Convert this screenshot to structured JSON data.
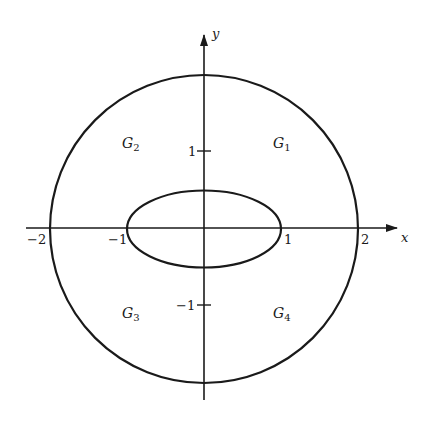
{
  "diagram": {
    "type": "region-plot",
    "colors": {
      "stroke": "#1a1a1a",
      "background": "#ffffff"
    },
    "axes": {
      "x_label": "x",
      "y_label": "y",
      "x_ticks": [
        {
          "value": -2,
          "label": "−2"
        },
        {
          "value": -1,
          "label": "−1"
        },
        {
          "value": 1,
          "label": "1"
        },
        {
          "value": 2,
          "label": "2"
        }
      ],
      "y_ticks": [
        {
          "value": 1,
          "label": "1"
        },
        {
          "value": -1,
          "label": "−1"
        }
      ]
    },
    "curves": {
      "circle": {
        "center": [
          0,
          0
        ],
        "radius": 2
      },
      "ellipse": {
        "center": [
          0,
          0
        ],
        "semi_x": 1,
        "semi_y": 0.5
      }
    },
    "regions": [
      {
        "id": "G1",
        "base": "G",
        "sub": "1",
        "quadrant": "upper-right"
      },
      {
        "id": "G2",
        "base": "G",
        "sub": "2",
        "quadrant": "upper-left"
      },
      {
        "id": "G3",
        "base": "G",
        "sub": "3",
        "quadrant": "lower-left"
      },
      {
        "id": "G4",
        "base": "G",
        "sub": "4",
        "quadrant": "lower-right"
      }
    ]
  }
}
